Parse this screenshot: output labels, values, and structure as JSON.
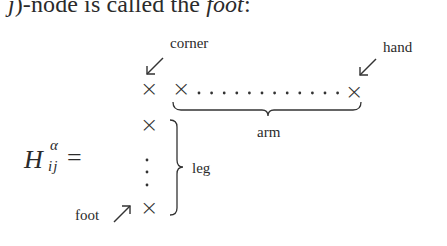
{
  "text": {
    "line_prefix_italic": "j",
    "line_middle": ")-node is called the ",
    "line_emph": "foot",
    "line_suffix": ":"
  },
  "diagram": {
    "lhs": {
      "symbol": "H",
      "superscript": "α",
      "subscript": "ij",
      "relation": "="
    },
    "labels": {
      "corner": "corner",
      "hand": "hand",
      "arm": "arm",
      "leg": "leg",
      "foot": "foot"
    },
    "cell_glyph": "×",
    "arrows": {
      "corner": "↙",
      "hand": "↙",
      "foot": "↗"
    },
    "arm_dots": 12,
    "leg_dots": 3
  }
}
